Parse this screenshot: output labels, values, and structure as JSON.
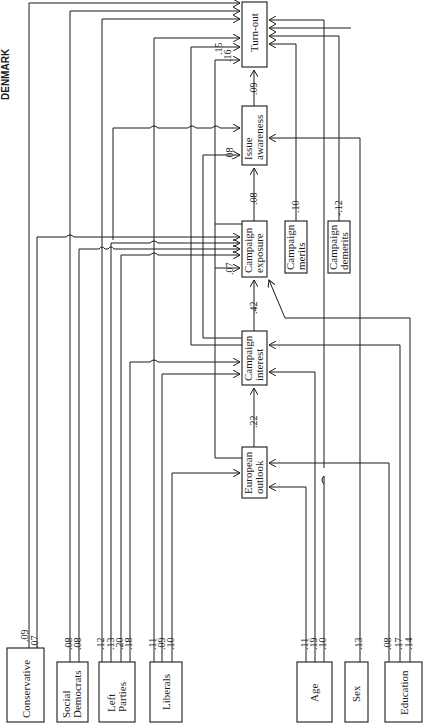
{
  "title": "DENMARK",
  "nodes": {
    "turnout": {
      "label": "Turn-out"
    },
    "issue_awareness": {
      "line1": "Issue",
      "line2": "awareness"
    },
    "campaign_exposure": {
      "line1": "Campaign",
      "line2": "exposure"
    },
    "campaign_interest": {
      "line1": "Campaign",
      "line2": "interest"
    },
    "european_outlook": {
      "line1": "European",
      "line2": "outlook"
    },
    "campaign_merits": {
      "line1": "Campaign",
      "line2": "merits"
    },
    "campaign_demerits": {
      "line1": "Campaign",
      "line2": "demerits"
    },
    "conservative": {
      "label": "Conservative"
    },
    "social_democrats": {
      "line1": "Social",
      "line2": "Democrats"
    },
    "left_parties": {
      "line1": "Left",
      "line2": "Parties"
    },
    "liberals": {
      "label": "Liberals"
    },
    "age": {
      "label": "Age"
    },
    "sex": {
      "label": "Sex"
    },
    "education": {
      "label": "Education"
    }
  },
  "paths": {
    "european_to_interest": ".22",
    "interest_to_exposure": ".42",
    "exposure_to_awareness": ".08",
    "awareness_to_turnout": ".09",
    "to_awareness_side": ".08",
    "to_exposure_side": ".07",
    "to_turnout_a": ".15",
    "to_turnout_b": ".16",
    "merits_to_awareness": ".10",
    "demerits_to_turnout": "-.12"
  },
  "source_coefficients": {
    "conservative": [
      ".09",
      ".07"
    ],
    "social_democrats": [
      ".08",
      ".08"
    ],
    "left_parties": [
      ".12",
      ".13",
      ".20",
      ".18"
    ],
    "liberals": [
      ".11",
      ".09",
      ".10"
    ],
    "age": [
      ".11",
      ".19",
      ".10"
    ],
    "sex": [
      ".13"
    ],
    "education": [
      ".08",
      ".17",
      ".14"
    ]
  }
}
